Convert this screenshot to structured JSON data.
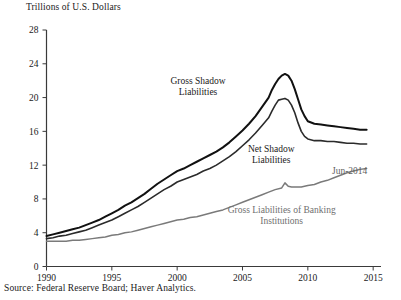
{
  "chart_data": {
    "type": "line",
    "title": "Trillions of U.S. Dollars",
    "xlabel": "",
    "ylabel": "Trillions of U.S. Dollars",
    "xlim": [
      1990,
      2015.6
    ],
    "ylim": [
      0,
      28
    ],
    "xticks": [
      1990,
      1995,
      2000,
      2005,
      2010,
      2015
    ],
    "yticks": [
      0,
      4,
      8,
      12,
      16,
      20,
      24,
      28
    ],
    "grid": false,
    "legend_position": "inline-annotations",
    "source": "Source: Federal Reserve Board; Haver Analytics.",
    "annotations": [
      {
        "text": "Jun-2014",
        "x": 2013.2,
        "y": 11.0,
        "color": "#5f5f5f"
      }
    ],
    "series": [
      {
        "name": "Gross Shadow Liabilities",
        "color": "#111111",
        "width": 2.0,
        "label_x": 2001.6,
        "label_y": 21.6,
        "x": [
          1990.0,
          1990.5,
          1991.0,
          1991.5,
          1992.0,
          1992.5,
          1993.0,
          1993.5,
          1994.0,
          1994.5,
          1995.0,
          1995.5,
          1996.0,
          1996.5,
          1997.0,
          1997.5,
          1998.0,
          1998.5,
          1999.0,
          1999.5,
          2000.0,
          2000.5,
          2001.0,
          2001.5,
          2002.0,
          2002.5,
          2003.0,
          2003.5,
          2004.0,
          2004.5,
          2005.0,
          2005.5,
          2006.0,
          2006.5,
          2007.0,
          2007.25,
          2007.5,
          2007.75,
          2008.0,
          2008.25,
          2008.5,
          2008.75,
          2009.0,
          2009.25,
          2009.5,
          2009.75,
          2010.0,
          2010.5,
          2011.0,
          2011.5,
          2012.0,
          2012.5,
          2013.0,
          2013.5,
          2014.0,
          2014.5
        ],
        "y": [
          3.6,
          3.8,
          4.0,
          4.2,
          4.4,
          4.6,
          4.9,
          5.2,
          5.5,
          5.9,
          6.3,
          6.7,
          7.2,
          7.6,
          8.1,
          8.6,
          9.2,
          9.8,
          10.3,
          10.8,
          11.3,
          11.6,
          12.0,
          12.4,
          12.8,
          13.2,
          13.6,
          14.1,
          14.7,
          15.4,
          16.1,
          16.9,
          17.8,
          18.9,
          20.0,
          20.9,
          21.6,
          22.2,
          22.6,
          22.8,
          22.6,
          22.0,
          21.0,
          19.8,
          18.6,
          17.8,
          17.2,
          16.9,
          16.8,
          16.7,
          16.6,
          16.5,
          16.4,
          16.3,
          16.2,
          16.2
        ]
      },
      {
        "name": "Net Shadow Liabilities",
        "color": "#2b2b2b",
        "width": 1.6,
        "label_x": 2007.2,
        "label_y": 13.6,
        "x": [
          1990.0,
          1990.5,
          1991.0,
          1991.5,
          1992.0,
          1992.5,
          1993.0,
          1993.5,
          1994.0,
          1994.5,
          1995.0,
          1995.5,
          1996.0,
          1996.5,
          1997.0,
          1997.5,
          1998.0,
          1998.5,
          1999.0,
          1999.5,
          2000.0,
          2000.5,
          2001.0,
          2001.5,
          2002.0,
          2002.5,
          2003.0,
          2003.5,
          2004.0,
          2004.5,
          2005.0,
          2005.5,
          2006.0,
          2006.5,
          2007.0,
          2007.25,
          2007.5,
          2007.75,
          2008.0,
          2008.25,
          2008.5,
          2008.75,
          2009.0,
          2009.25,
          2009.5,
          2009.75,
          2010.0,
          2010.5,
          2011.0,
          2011.5,
          2012.0,
          2012.5,
          2013.0,
          2013.5,
          2014.0,
          2014.5
        ],
        "y": [
          3.3,
          3.4,
          3.6,
          3.7,
          3.9,
          4.1,
          4.3,
          4.6,
          4.9,
          5.2,
          5.5,
          5.9,
          6.3,
          6.7,
          7.1,
          7.6,
          8.1,
          8.6,
          9.1,
          9.5,
          10.0,
          10.3,
          10.6,
          10.9,
          11.3,
          11.6,
          12.0,
          12.5,
          13.0,
          13.6,
          14.3,
          15.0,
          15.8,
          16.7,
          17.6,
          18.4,
          19.1,
          19.7,
          19.8,
          19.9,
          19.7,
          19.1,
          18.2,
          17.0,
          16.0,
          15.4,
          15.1,
          14.9,
          14.9,
          14.8,
          14.8,
          14.7,
          14.6,
          14.6,
          14.5,
          14.5
        ]
      },
      {
        "name": "Gross Liabilities of Banking Institutions",
        "color": "#7a7a7a",
        "width": 1.5,
        "label_x": 2008.0,
        "label_y": 6.3,
        "x": [
          1990.0,
          1990.5,
          1991.0,
          1991.5,
          1992.0,
          1992.5,
          1993.0,
          1993.5,
          1994.0,
          1994.5,
          1995.0,
          1995.5,
          1996.0,
          1996.5,
          1997.0,
          1997.5,
          1998.0,
          1998.5,
          1999.0,
          1999.5,
          2000.0,
          2000.5,
          2001.0,
          2001.5,
          2002.0,
          2002.5,
          2003.0,
          2003.5,
          2004.0,
          2004.5,
          2005.0,
          2005.5,
          2006.0,
          2006.5,
          2007.0,
          2007.5,
          2008.0,
          2008.25,
          2008.5,
          2008.75,
          2009.0,
          2009.25,
          2009.5,
          2009.75,
          2010.0,
          2010.5,
          2011.0,
          2011.5,
          2012.0,
          2012.5,
          2013.0,
          2013.5,
          2014.0,
          2014.5
        ],
        "y": [
          3.0,
          3.0,
          3.0,
          3.0,
          3.1,
          3.1,
          3.2,
          3.3,
          3.4,
          3.5,
          3.7,
          3.8,
          4.0,
          4.1,
          4.3,
          4.5,
          4.7,
          4.9,
          5.1,
          5.3,
          5.5,
          5.6,
          5.8,
          5.9,
          6.1,
          6.3,
          6.5,
          6.7,
          7.0,
          7.3,
          7.6,
          7.9,
          8.2,
          8.5,
          8.8,
          9.1,
          9.3,
          9.9,
          9.5,
          9.4,
          9.4,
          9.4,
          9.4,
          9.5,
          9.6,
          9.7,
          10.0,
          10.2,
          10.5,
          10.8,
          11.1,
          11.3,
          11.5,
          11.6
        ]
      }
    ]
  },
  "labels": {
    "gross_shadow_line1": "Gross Shadow",
    "gross_shadow_line2": "Liabilities",
    "net_shadow_line1": "Net Shadow",
    "net_shadow_line2": "Liabilities",
    "banking_line1": "Gross Liabilities of Banking",
    "banking_line2": "Institutions",
    "jun_2014": "Jun-2014"
  },
  "axis": {
    "title": "Trillions of U.S. Dollars",
    "source": "Source: Federal Reserve Board; Haver Analytics."
  }
}
